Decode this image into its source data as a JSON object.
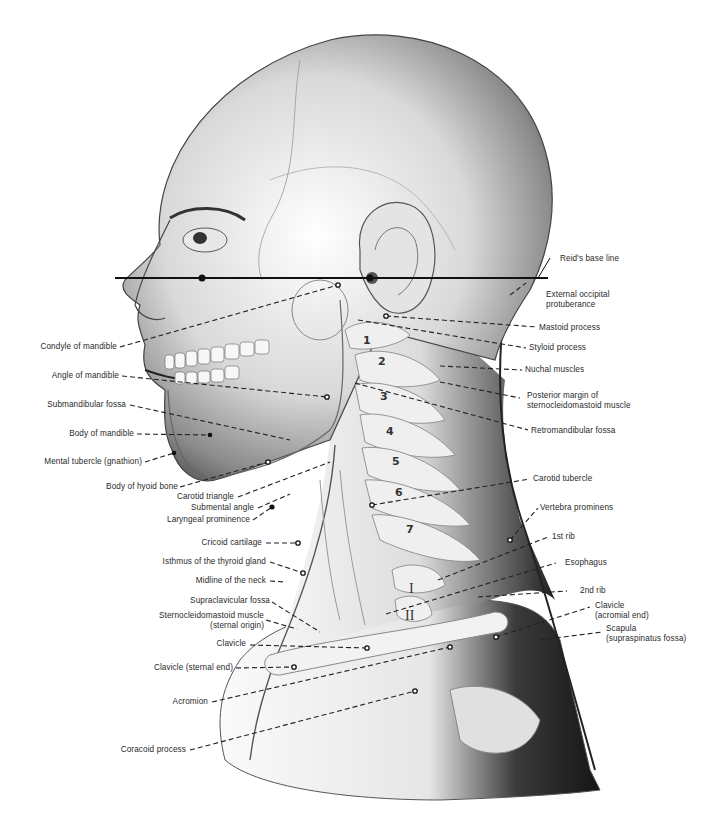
{
  "figure": {
    "colors": {
      "line": "#1a1a1a",
      "text": "#2a2a2a",
      "skin_dark": "#1c1c1c",
      "background": "#ffffff"
    }
  },
  "labels_left": [
    {
      "id": "condyle",
      "text": "Condyle of mandible"
    },
    {
      "id": "angle",
      "text": "Angle of mandible"
    },
    {
      "id": "submandibular",
      "text": "Submandibular fossa"
    },
    {
      "id": "body_mandible",
      "text": "Body of mandible"
    },
    {
      "id": "mental",
      "text": "Mental tubercle (gnathion)"
    },
    {
      "id": "hyoid",
      "text": "Body of hyoid bone"
    },
    {
      "id": "carotid_triangle",
      "text": "Carotid triangle"
    },
    {
      "id": "submental",
      "text": "Submental angle"
    },
    {
      "id": "laryngeal",
      "text": "Laryngeal prominence"
    },
    {
      "id": "cricoid",
      "text": "Cricoid cartilage"
    },
    {
      "id": "isthmus",
      "text": "Isthmus of the thyroid gland"
    },
    {
      "id": "midline",
      "text": "Midline of the neck"
    },
    {
      "id": "supraclavicular",
      "text": "Supraclavicular fossa"
    },
    {
      "id": "scm_line1",
      "text": "Sternocleidomastoid muscle"
    },
    {
      "id": "scm_line2",
      "text": "(sternal origin)"
    },
    {
      "id": "clavicle",
      "text": "Clavicle"
    },
    {
      "id": "clavicle_sternal",
      "text": "Clavicle (sternal end)"
    },
    {
      "id": "acromion",
      "text": "Acromion"
    },
    {
      "id": "coracoid",
      "text": "Coracoid process"
    }
  ],
  "labels_right": [
    {
      "id": "reid",
      "text": "Reid's base line"
    },
    {
      "id": "occipital_line1",
      "text": "External occipital"
    },
    {
      "id": "occipital_line2",
      "text": "protuberance"
    },
    {
      "id": "mastoid",
      "text": "Mastoid process"
    },
    {
      "id": "styloid",
      "text": "Styloid process"
    },
    {
      "id": "nuchal",
      "text": "Nuchal muscles"
    },
    {
      "id": "posterior_line1",
      "text": "Posterior margin of"
    },
    {
      "id": "posterior_line2",
      "text": "sternocleidomastoid muscle"
    },
    {
      "id": "retromandibular",
      "text": "Retromandibular fossa"
    },
    {
      "id": "carotid_tubercle",
      "text": "Carotid tubercle"
    },
    {
      "id": "vertebra_prominens",
      "text": "Vertebra prominens"
    },
    {
      "id": "rib1",
      "text": "1st rib"
    },
    {
      "id": "esophagus",
      "text": "Esophagus"
    },
    {
      "id": "rib2",
      "text": "2nd rib"
    },
    {
      "id": "clav_acromial_line1",
      "text": "Clavicle"
    },
    {
      "id": "clav_acromial_line2",
      "text": "(acromial end)"
    },
    {
      "id": "scapula_line1",
      "text": "Scapula"
    },
    {
      "id": "scapula_line2",
      "text": "(supraspinatus fossa)"
    }
  ],
  "vertebrae": [
    "1",
    "2",
    "3",
    "4",
    "5",
    "6",
    "7"
  ],
  "ribs": [
    "I",
    "II"
  ]
}
